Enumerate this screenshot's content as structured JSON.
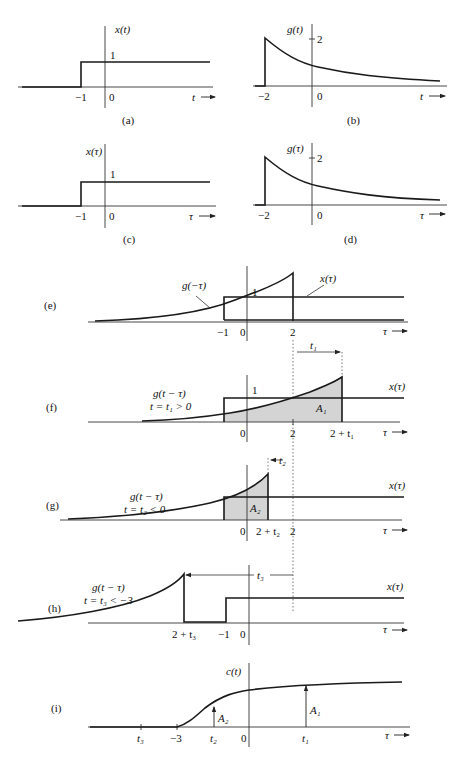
{
  "panels": {
    "a": {
      "caption": "(a)",
      "ylabel": "x(t)",
      "level": "1",
      "ticks": [
        "−1",
        "0"
      ],
      "xlabel": "t"
    },
    "b": {
      "caption": "(b)",
      "ylabel": "g(t)",
      "level": "2",
      "ticks": [
        "−2",
        "0"
      ],
      "xlabel": "t"
    },
    "c": {
      "caption": "(c)",
      "ylabel": "x(τ)",
      "level": "1",
      "ticks": [
        "−1",
        "0"
      ],
      "xlabel": "τ"
    },
    "d": {
      "caption": "(d)",
      "ylabel": "g(τ)",
      "level": "2",
      "ticks": [
        "−2",
        "0"
      ],
      "xlabel": "τ"
    },
    "e": {
      "caption": "(e)",
      "curve_label": "g(−τ)",
      "signal_label": "x(τ)",
      "level": "1",
      "ticks": [
        "−1",
        "0",
        "2"
      ],
      "xlabel": "τ"
    },
    "f": {
      "caption": "(f)",
      "curve_label_1": "g(t − τ)",
      "curve_label_2": "t = t₁ > 0",
      "signal_label": "x(τ)",
      "level": "1",
      "area": "A₁",
      "shift": "t₁",
      "ticks": [
        "0",
        "2",
        "2 + t₁"
      ],
      "xlabel": "τ"
    },
    "g": {
      "caption": "(g)",
      "curve_label_1": "g(t − τ)",
      "curve_label_2": "t = t₂ < 0",
      "signal_label": "x(τ)",
      "area": "A₂",
      "shift": "t₂",
      "ticks": [
        "0",
        "2 + t₂",
        "2"
      ],
      "xlabel": "τ"
    },
    "h": {
      "caption": "(h)",
      "curve_label_1": "g(t − τ)",
      "curve_label_2": "t = t₃ < −3",
      "signal_label": "x(τ)",
      "shift": "t₃",
      "ticks": [
        "2 + t₃",
        "−1",
        "0"
      ],
      "xlabel": "τ"
    },
    "i": {
      "caption": "(i)",
      "ylabel": "c(t)",
      "ticks": [
        "t₃",
        "−3",
        "t₂",
        "0",
        "t₁"
      ],
      "arrow_labels": [
        "A₂",
        "A₁"
      ],
      "xlabel": "τ"
    }
  },
  "colors": {
    "ink": "#1a1a1a",
    "shade": "#d4d4d4"
  }
}
